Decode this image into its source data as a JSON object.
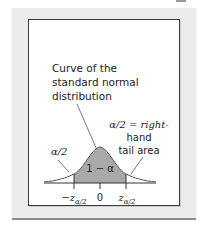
{
  "figure": {
    "curve_label_lines": [
      "Curve of the",
      "standard normal",
      "distribution"
    ],
    "right_tail_label_lines": [
      "α/2 = right-",
      "hand",
      "tail area"
    ],
    "left_tail_label": "α/2",
    "center_area_label": "1 − α",
    "ticks": {
      "left": {
        "sign": "−",
        "var": "z",
        "sub": "α/2"
      },
      "center": "0",
      "right": {
        "var": "z",
        "sub": "α/2"
      }
    },
    "colors": {
      "panel_bg": "#ececec",
      "box_border": "#3a3a3a",
      "center_fill": "#a9a9a9",
      "tail_fill": "#ffffff",
      "curve_stroke": "#555555"
    }
  }
}
